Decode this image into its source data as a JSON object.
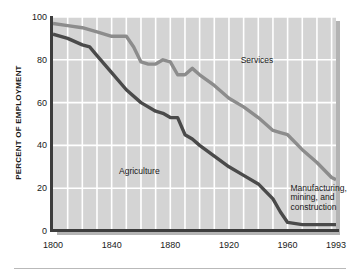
{
  "chart_data": {
    "type": "line",
    "title": "",
    "subtitle": "",
    "xlabel": "",
    "ylabel": "PERCENT OF EMPLOYMENT",
    "xlim": [
      1800,
      1993
    ],
    "ylim": [
      0,
      100
    ],
    "grid": true,
    "grid_color": "#ffffff",
    "plot_background": "#d4d4d4",
    "legend_position": "inline-annotations",
    "xticks": [
      1800,
      1840,
      1880,
      1920,
      1960,
      1993
    ],
    "xtick_labels": [
      "1800",
      "1840",
      "1880",
      "1920",
      "1960",
      "1993"
    ],
    "yticks": [
      0,
      20,
      40,
      60,
      80,
      100
    ],
    "ytick_labels": [
      "0",
      "20",
      "40",
      "60",
      "80",
      "100"
    ],
    "series": [
      {
        "name": "Services",
        "color": "#8c8c8c",
        "label_position": "upper-right",
        "x": [
          1800,
          1810,
          1820,
          1830,
          1840,
          1850,
          1855,
          1860,
          1865,
          1870,
          1875,
          1880,
          1885,
          1890,
          1895,
          1900,
          1910,
          1920,
          1930,
          1940,
          1950,
          1955,
          1960,
          1970,
          1980,
          1990,
          1993
        ],
        "values": [
          97,
          96,
          95,
          93,
          91,
          91,
          86,
          79,
          78,
          78,
          80,
          79,
          73,
          73,
          76,
          73,
          68,
          62,
          58,
          53,
          47,
          46,
          45,
          38,
          32,
          25,
          24
        ]
      },
      {
        "name": "Agriculture",
        "color": "#4a4a4a",
        "label_position": "center-left",
        "x": [
          1800,
          1810,
          1820,
          1825,
          1830,
          1840,
          1850,
          1860,
          1870,
          1875,
          1880,
          1885,
          1890,
          1895,
          1900,
          1910,
          1920,
          1930,
          1940,
          1950,
          1955,
          1960,
          1970,
          1980,
          1990,
          1993
        ],
        "values": [
          92,
          90,
          87,
          86,
          82,
          74,
          66,
          60,
          56,
          55,
          53,
          53,
          45,
          43,
          40,
          35,
          30,
          26,
          22,
          15,
          9,
          4,
          3,
          3,
          3,
          3
        ]
      }
    ],
    "annotations": [
      {
        "text": "Services",
        "x": 1928,
        "y": 82
      },
      {
        "text": "Agriculture",
        "x": 1845,
        "y": 30
      },
      {
        "text": "Manufacturing,\nmining, and\nconstruction",
        "x": 1962,
        "y": 22
      }
    ]
  }
}
